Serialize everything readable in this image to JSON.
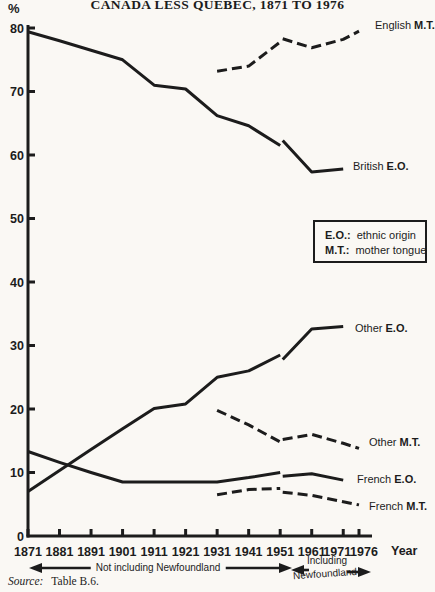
{
  "colors": {
    "ink": "#1c1c1c",
    "paper": "#faf8f4"
  },
  "header": {
    "title": "CANADA LESS QUEBEC, 1871 TO 1976",
    "y_unit": "%"
  },
  "legend": {
    "rows": [
      {
        "abbr": "E.O.:",
        "definition": "ethnic origin"
      },
      {
        "abbr": "M.T.:",
        "definition": "mother tongue"
      }
    ]
  },
  "footer": {
    "x_axis_word": "Year",
    "left_span_label": "Not including Newfoundland",
    "right_span_label_line1": "Including",
    "right_span_label_line2": "Newfoundland",
    "source_label": "Source:",
    "source_value": "Table B.6."
  },
  "chart_data": {
    "type": "line",
    "title": "CANADA LESS QUEBEC, 1871 TO 1976",
    "xlabel": "Year",
    "ylabel": "%",
    "xlim": [
      1871,
      1976
    ],
    "ylim": [
      0,
      80
    ],
    "grid": false,
    "x_ticks": [
      1871,
      1881,
      1891,
      1901,
      1911,
      1921,
      1931,
      1941,
      1951,
      1961,
      1971,
      1976
    ],
    "y_ticks": [
      0,
      10,
      20,
      30,
      40,
      50,
      60,
      70,
      80
    ],
    "break_note": "Series break at 1951: left segments exclude Newfoundland, right segments include Newfoundland",
    "annotations": [
      {
        "text": "Not including Newfoundland",
        "span_years": [
          1871,
          1951
        ]
      },
      {
        "text": "Including Newfoundland",
        "span_years": [
          1951,
          1976
        ]
      }
    ],
    "series": [
      {
        "id": "english-mt",
        "name": "English",
        "abbr": "M.T.",
        "style": "dashed",
        "segments": [
          {
            "label": "not including Newfoundland",
            "points": [
              [
                1931,
                73.2
              ],
              [
                1941,
                74.0
              ],
              [
                1951,
                77.8
              ]
            ]
          },
          {
            "label": "including Newfoundland",
            "points": [
              [
                1951.8,
                78.3
              ],
              [
                1961,
                76.9
              ],
              [
                1971,
                78.2
              ],
              [
                1976,
                79.5
              ]
            ]
          }
        ]
      },
      {
        "id": "british-eo",
        "name": "British",
        "abbr": "E.O.",
        "style": "solid",
        "segments": [
          {
            "label": "not including Newfoundland",
            "points": [
              [
                1871,
                79.4
              ],
              [
                1881,
                78.0
              ],
              [
                1891,
                76.5
              ],
              [
                1901,
                75.0
              ],
              [
                1911,
                71.0
              ],
              [
                1921,
                70.4
              ],
              [
                1931,
                66.2
              ],
              [
                1941,
                64.6
              ],
              [
                1951,
                61.5
              ]
            ]
          },
          {
            "label": "including Newfoundland",
            "points": [
              [
                1951.8,
                62.3
              ],
              [
                1961,
                57.3
              ],
              [
                1971,
                57.8
              ]
            ]
          }
        ]
      },
      {
        "id": "other-eo",
        "name": "Other",
        "abbr": "E.O.",
        "style": "solid",
        "segments": [
          {
            "label": "not including Newfoundland",
            "points": [
              [
                1871,
                7.0
              ],
              [
                1881,
                10.3
              ],
              [
                1891,
                13.6
              ],
              [
                1901,
                16.9
              ],
              [
                1911,
                20.1
              ],
              [
                1921,
                20.8
              ],
              [
                1931,
                25.0
              ],
              [
                1941,
                26.0
              ],
              [
                1951,
                28.5
              ]
            ]
          },
          {
            "label": "including Newfoundland",
            "points": [
              [
                1951.8,
                27.8
              ],
              [
                1961,
                32.6
              ],
              [
                1971,
                33.0
              ]
            ]
          }
        ]
      },
      {
        "id": "other-mt",
        "name": "Other",
        "abbr": "M.T.",
        "style": "dashed",
        "segments": [
          {
            "label": "not including Newfoundland",
            "points": [
              [
                1931,
                19.8
              ],
              [
                1941,
                17.5
              ],
              [
                1951,
                14.8
              ]
            ]
          },
          {
            "label": "including Newfoundland",
            "points": [
              [
                1951.8,
                15.2
              ],
              [
                1961,
                16.0
              ],
              [
                1971,
                14.6
              ],
              [
                1976,
                13.8
              ]
            ]
          }
        ]
      },
      {
        "id": "french-eo",
        "name": "French",
        "abbr": "E.O.",
        "style": "solid",
        "segments": [
          {
            "label": "not including Newfoundland",
            "points": [
              [
                1871,
                13.3
              ],
              [
                1881,
                11.6
              ],
              [
                1891,
                10.0
              ],
              [
                1901,
                8.5
              ],
              [
                1911,
                8.5
              ],
              [
                1921,
                8.5
              ],
              [
                1931,
                8.5
              ],
              [
                1941,
                9.2
              ],
              [
                1951,
                10.0
              ]
            ]
          },
          {
            "label": "including Newfoundland",
            "points": [
              [
                1951.8,
                9.4
              ],
              [
                1961,
                9.8
              ],
              [
                1971,
                8.8
              ]
            ]
          }
        ]
      },
      {
        "id": "french-mt",
        "name": "French",
        "abbr": "M.T.",
        "style": "dashed",
        "segments": [
          {
            "label": "not including Newfoundland",
            "points": [
              [
                1931,
                6.5
              ],
              [
                1941,
                7.3
              ],
              [
                1951,
                7.5
              ]
            ]
          },
          {
            "label": "including Newfoundland",
            "points": [
              [
                1951.8,
                6.9
              ],
              [
                1961,
                6.4
              ],
              [
                1971,
                5.4
              ],
              [
                1976,
                4.9
              ]
            ]
          }
        ]
      }
    ]
  },
  "series_label_positions": {
    "english-mt": {
      "left": 375,
      "top": 20
    },
    "british-eo": {
      "left": 353,
      "top": 161
    },
    "other-eo": {
      "left": 355,
      "top": 323
    },
    "other-mt": {
      "left": 369,
      "top": 437
    },
    "french-eo": {
      "left": 357,
      "top": 474
    },
    "french-mt": {
      "left": 369,
      "top": 501
    }
  }
}
